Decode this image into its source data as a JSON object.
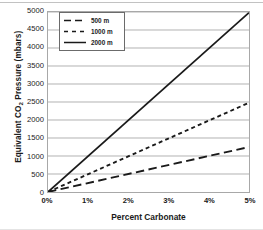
{
  "chart_data": {
    "type": "line",
    "title": "",
    "xlabel": "Percent Carbonate",
    "ylabel": "Equivalent CO2 Pressure (mbars)",
    "ylabel_prefix": "Equivalent CO",
    "ylabel_subscript": "2",
    "ylabel_suffix": " Pressure (mbars)",
    "xlim": [
      0,
      5
    ],
    "ylim": [
      0,
      5000
    ],
    "x_ticks": [
      0,
      1,
      2,
      3,
      4,
      5
    ],
    "x_tick_labels": [
      "0%",
      "1%",
      "2%",
      "3%",
      "4%",
      "5%"
    ],
    "y_ticks": [
      0,
      500,
      1000,
      1500,
      2000,
      2500,
      3000,
      3500,
      4000,
      4500,
      5000
    ],
    "y_tick_labels": [
      "0",
      "500",
      "1000",
      "1500",
      "2000",
      "2500",
      "3000",
      "3500",
      "4000",
      "4500",
      "5000"
    ],
    "grid": "horizontal",
    "legend_position": "top-left",
    "x": [
      0,
      5
    ],
    "series": [
      {
        "name": "500 m",
        "style": "long-dash",
        "color": "#1a1a1a",
        "values": [
          0,
          1250
        ]
      },
      {
        "name": "1000 m",
        "style": "short-dash",
        "color": "#1a1a1a",
        "values": [
          0,
          2480
        ]
      },
      {
        "name": "2000 m",
        "style": "solid",
        "color": "#1a1a1a",
        "values": [
          0,
          4980
        ]
      }
    ]
  },
  "legend": {
    "items": [
      {
        "label": "500 m"
      },
      {
        "label": "1000 m"
      },
      {
        "label": "2000 m"
      }
    ]
  },
  "colors": {
    "line": "#1a1a1a",
    "grid": "#a8a8a8",
    "frame": "#a8a8a8"
  }
}
